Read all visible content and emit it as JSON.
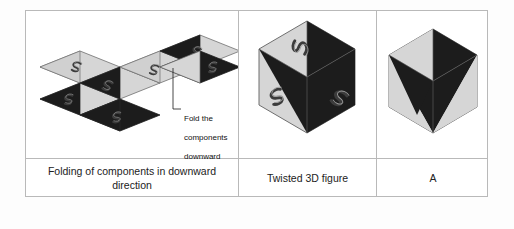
{
  "figure": {
    "kind": "folding-net-to-3d-figure-diagram",
    "columns": 3,
    "rows": 2
  },
  "panels": {
    "net": {
      "caption": "Folding of components in downward direction",
      "annotation": "Fold the\ncomponents\ndownward",
      "annotation_lines": [
        "Fold the",
        "components",
        "downward"
      ],
      "description": "Unfolded net of rhombic faces, each split into a light-gray triangle and a black triangle, arranged in a zigzag strip",
      "face_count": 6,
      "glyph": "S",
      "glyph_count": 6
    },
    "twisted": {
      "caption": "Twisted 3D figure",
      "description": "Hexagonal cube outline with three black triangular wedges meeting at the center forming a pinwheel, glyph on each of the three visible faces",
      "visible_faces": 3,
      "glyph": "S",
      "glyph_count": 3
    },
    "answer": {
      "caption": "A",
      "label": "A",
      "description": "Hexagonal cube outline with black wedges on top and left faces and a black triangle on the front face"
    }
  },
  "colors": {
    "face_light": "#d4d4d4",
    "face_light_alt": "#c9c9c9",
    "face_dark": "#1c1c1c",
    "outline": "#6b6b6b",
    "border": "#b9b9b9",
    "background": "#ffffff",
    "text": "#222222",
    "glyph": "#3a3a3a"
  }
}
